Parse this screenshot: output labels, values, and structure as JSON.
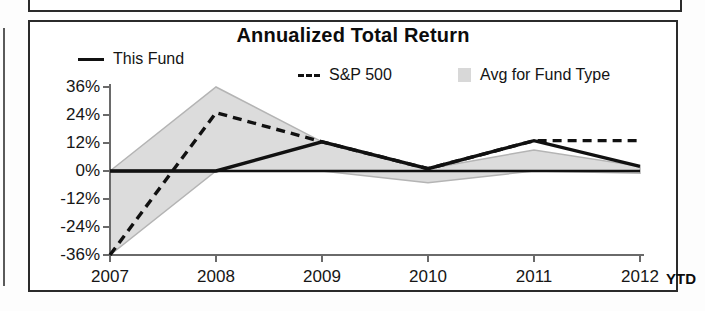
{
  "panel": {
    "title": "Annualized Total Return"
  },
  "legend": {
    "items": [
      {
        "label": "This Fund",
        "marker": "solid-line-swatch"
      },
      {
        "label": "S&P 500",
        "marker": "dashed-line-swatch"
      },
      {
        "label": "Avg for Fund Type",
        "marker": "gray-box-swatch"
      }
    ]
  },
  "axis": {
    "y_ticks": [
      "36%",
      "24%",
      "12%",
      "0%",
      "-12%",
      "-24%",
      "-36%"
    ],
    "x_ticks": [
      "2007",
      "2008",
      "2009",
      "2010",
      "2011",
      "2012"
    ],
    "x_suffix": "YTD"
  },
  "colors": {
    "line": "#111111",
    "band": "#dcdcdc",
    "band_edge": "#b4b4b4",
    "frame": "#2b2b2b",
    "text": "#141414"
  },
  "chart_data": {
    "type": "line",
    "title": "Annualized Total Return",
    "xlabel": "",
    "ylabel": "",
    "x": [
      "2007",
      "2008",
      "2009",
      "2010",
      "2011",
      "2012"
    ],
    "ylim": [
      -36,
      36
    ],
    "ytick_values": [
      36,
      24,
      12,
      0,
      -12,
      -24,
      -36
    ],
    "grid": false,
    "legend_position": "top",
    "x_note": "YTD",
    "series": [
      {
        "name": "This Fund",
        "style": "solid",
        "values": [
          0,
          0,
          12.5,
          1,
          13,
          2
        ]
      },
      {
        "name": "S&P 500",
        "style": "dashed",
        "values": [
          -36,
          25,
          12.5,
          1,
          13,
          13
        ]
      },
      {
        "name": "Avg for Fund Type",
        "style": "band",
        "upper": [
          0,
          36,
          12.5,
          1,
          9,
          2
        ],
        "lower": [
          -36,
          0,
          0,
          -5,
          0,
          -1
        ]
      }
    ]
  }
}
